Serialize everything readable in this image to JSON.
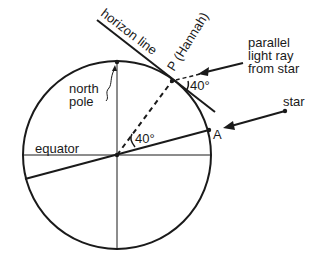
{
  "diagram": {
    "labels": {
      "horizon_line": "horizon line",
      "point_p": "P (Hannah)",
      "parallel_ray_1": "parallel",
      "parallel_ray_2": "light ray",
      "parallel_ray_3": "from star",
      "north_pole_1": "north",
      "north_pole_2": "pole",
      "equator": "equator",
      "star": "star",
      "point_a": "A",
      "angle_p": "40°",
      "angle_center": "40°"
    }
  }
}
